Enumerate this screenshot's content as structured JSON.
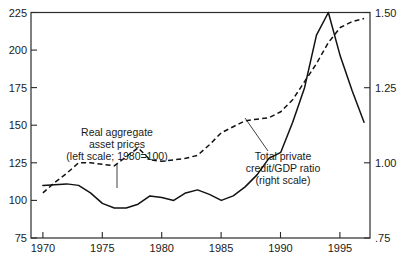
{
  "chart_data": {
    "type": "line",
    "title": "",
    "subtitle": "",
    "xlabel": "",
    "ylabel": "",
    "grid": false,
    "legend_position": "inline-annotations",
    "x": [
      1970,
      1971,
      1972,
      1973,
      1974,
      1975,
      1976,
      1977,
      1978,
      1979,
      1980,
      1981,
      1982,
      1983,
      1984,
      1985,
      1986,
      1987,
      1988,
      1989,
      1990,
      1991,
      1992,
      1993,
      1994,
      1995,
      1996,
      1997
    ],
    "xlim": [
      1969,
      1997.5
    ],
    "xticks": [
      1970,
      1975,
      1980,
      1985,
      1990,
      1995
    ],
    "xtick_labels": [
      "1970",
      "1975",
      "1980",
      "1985",
      "1990",
      "1995"
    ],
    "left_axis": {
      "label": "Real aggregate asset prices (left scale; 1980=100)",
      "ylim": [
        75,
        225
      ],
      "yticks": [
        75,
        100,
        125,
        150,
        175,
        200,
        225
      ],
      "ytick_labels": [
        "75",
        "100",
        "125",
        "150",
        "175",
        "200",
        "225"
      ]
    },
    "right_axis": {
      "label": "Total private credit/GDP ratio (right scale)",
      "ylim": [
        0.75,
        1.5
      ],
      "yticks": [
        0.75,
        1.0,
        1.25,
        1.5
      ],
      "ytick_labels": [
        ".75",
        "1.00",
        "1.25",
        "1.50"
      ]
    },
    "series": [
      {
        "name": "Real aggregate asset prices",
        "style": "solid",
        "axis": "left",
        "values": [
          110,
          110.5,
          111,
          110,
          105,
          98,
          95,
          95,
          97.5,
          103,
          102,
          100,
          105,
          107,
          104,
          100,
          103,
          109,
          117,
          128,
          132,
          152,
          175,
          210,
          225,
          196,
          173,
          152
        ]
      },
      {
        "name": "Total private credit/GDP ratio",
        "style": "dashed",
        "axis": "right",
        "values": [
          0.9,
          0.935,
          0.965,
          1.0,
          1.0,
          0.995,
          0.99,
          1.02,
          1.05,
          1.01,
          1.005,
          1.01,
          1.015,
          1.025,
          1.06,
          1.1,
          1.12,
          1.14,
          1.145,
          1.15,
          1.17,
          1.21,
          1.27,
          1.33,
          1.4,
          1.45,
          1.47,
          1.48
        ]
      }
    ],
    "annotations": [
      {
        "name": "left-series-annotation",
        "lines": [
          "Real aggregate",
          "asset prices",
          "(left scale; 1980=100)"
        ]
      },
      {
        "name": "right-series-annotation",
        "lines": [
          "Total private",
          "credit/GDP ratio",
          "(right scale)"
        ]
      }
    ]
  }
}
